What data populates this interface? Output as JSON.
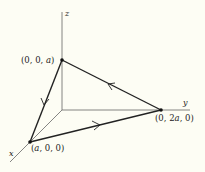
{
  "diagram": {
    "axes": {
      "x": {
        "label": "x"
      },
      "y": {
        "label": "y"
      },
      "z": {
        "label": "z"
      }
    },
    "points": [
      {
        "id": "P1",
        "label": "(0, 0, a)"
      },
      {
        "id": "P2",
        "label": "(0, 2a, 0)"
      },
      {
        "id": "P3",
        "label": "(a, 0, 0)"
      }
    ],
    "path_direction": [
      "(0, 2a, 0) → (0, 0, a)",
      "(0, 0, a) → (a, 0, 0)",
      "(a, 0, 0) → (0, 2a, 0)"
    ],
    "colors": {
      "background": "#fdfdf4",
      "axis": "#555555",
      "path": "#222222"
    }
  }
}
